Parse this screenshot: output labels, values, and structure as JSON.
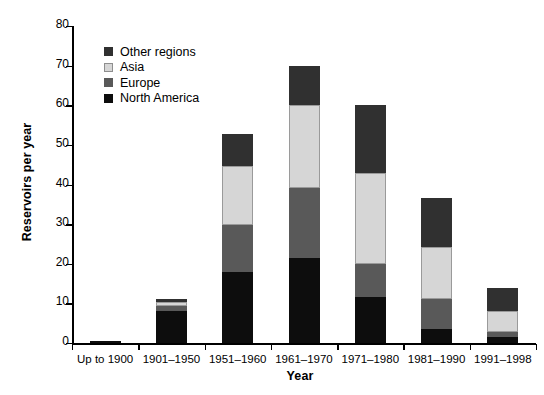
{
  "chart_data": {
    "type": "bar",
    "subtype": "stacked-bar",
    "title": "",
    "xlabel": "Year",
    "ylabel": "Reservoirs per year",
    "ylim": [
      0,
      80
    ],
    "ytick_step": 10,
    "yticks": [
      "0",
      "10",
      "20",
      "30",
      "40",
      "50",
      "60",
      "70",
      "80"
    ],
    "grid": false,
    "legend_position": "inside top-left",
    "categories": [
      "Up to 1900",
      "1901–1950",
      "1951–1960",
      "1961–1970",
      "1971–1980",
      "1981–1990",
      "1991–1998"
    ],
    "series": [
      {
        "name": "North America",
        "color": "#0d0d0d",
        "values": [
          0.5,
          8.2,
          18.0,
          21.5,
          11.7,
          3.6,
          1.4
        ]
      },
      {
        "name": "Europe",
        "color": "#595959",
        "values": [
          0.0,
          1.2,
          11.8,
          17.5,
          8.3,
          7.4,
          1.5
        ]
      },
      {
        "name": "Asia",
        "color": "#d6d6d6",
        "values": [
          0.0,
          1.0,
          14.9,
          21.0,
          23.0,
          13.3,
          5.1
        ]
      },
      {
        "name": "Other regions",
        "color": "#303030",
        "values": [
          0.0,
          0.8,
          8.0,
          10.0,
          17.0,
          12.3,
          6.0
        ]
      }
    ],
    "totals": [
      0.5,
      11.2,
      52.7,
      70.0,
      60.0,
      36.6,
      14.0
    ],
    "legend_order": [
      "Other regions",
      "Asia",
      "Europe",
      "North America"
    ]
  },
  "colors": {
    "other_regions": "#303030",
    "asia": "#d6d6d6",
    "europe": "#595959",
    "north_america": "#0d0d0d",
    "axis": "#000000",
    "background": "#ffffff"
  }
}
